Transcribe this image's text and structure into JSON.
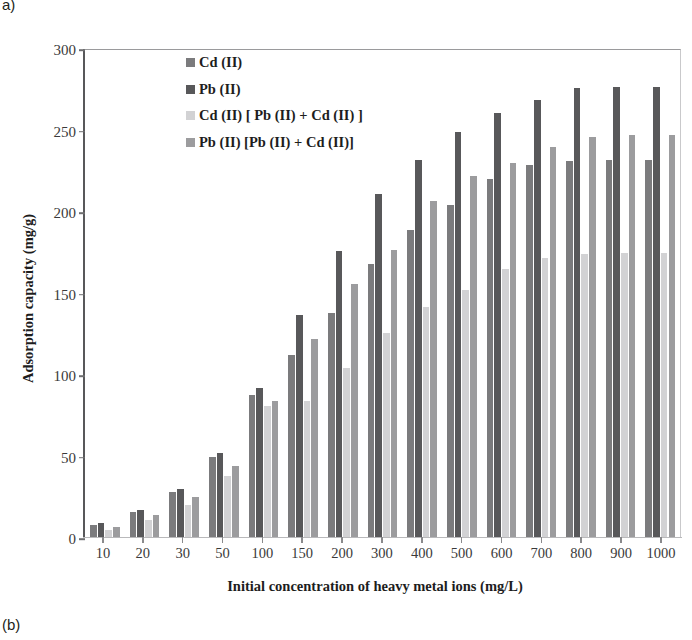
{
  "panels": {
    "top_tag": "a)",
    "bottom_tag": "(b)"
  },
  "chart_data": {
    "type": "bar",
    "title": "",
    "subtitle": "",
    "xlabel": "Initial concentration of heavy metal ions  (mg/L)",
    "ylabel": "Adsorption capacity (mg/g)",
    "ylim": [
      0,
      300
    ],
    "yticks": [
      0,
      50,
      100,
      150,
      200,
      250,
      300
    ],
    "grid": false,
    "legend_position": "inside-top-center",
    "categories": [
      "10",
      "20",
      "30",
      "50",
      "100",
      "150",
      "200",
      "300",
      "400",
      "500",
      "600",
      "700",
      "800",
      "900",
      "1000"
    ],
    "series": [
      {
        "name": "Cd (II)",
        "color": "#7b7b7d",
        "values": [
          8,
          16,
          28,
          50,
          88,
          112,
          138,
          168,
          189,
          204,
          220,
          229,
          231,
          232,
          232
        ]
      },
      {
        "name": "Pb (II)",
        "color": "#58585a",
        "values": [
          9,
          17,
          30,
          52,
          92,
          137,
          176,
          211,
          232,
          249,
          261,
          269,
          276,
          277,
          277
        ]
      },
      {
        "name": "Cd (II) [ Pb (II) + Cd (II) ]",
        "color": "#d2d2d4",
        "values": [
          5,
          11,
          20,
          38,
          81,
          84,
          104,
          126,
          142,
          152,
          165,
          172,
          174,
          175,
          175
        ]
      },
      {
        "name": "Pb (II) [Pb (II) + Cd (II)]",
        "color": "#9c9c9e",
        "values": [
          7,
          14,
          25,
          44,
          84,
          122,
          156,
          177,
          207,
          222,
          230,
          240,
          246,
          247,
          247
        ]
      }
    ]
  }
}
